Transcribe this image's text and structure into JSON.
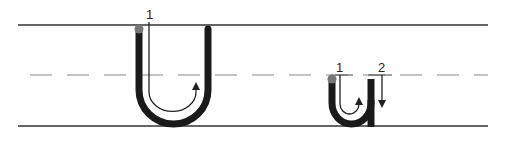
{
  "diagram": {
    "colors": {
      "background": "#ffffff",
      "guide_line": "#333333",
      "dashed_line": "#888888",
      "stroke": "#1a1a1a",
      "start_dot": "#777777",
      "arrow": "#222222"
    },
    "guide_lines": {
      "top_y": 25,
      "mid_y": 75,
      "base_y": 126,
      "x_start": 18,
      "x_end": 488
    },
    "letters": [
      {
        "id": "uppercase-U",
        "glyph": "U",
        "stroke_labels": [
          {
            "label": "1",
            "x": 150,
            "y": 18
          }
        ]
      },
      {
        "id": "lowercase-u",
        "glyph": "u",
        "stroke_labels": [
          {
            "label": "1",
            "x": 340,
            "y": 71
          },
          {
            "label": "2",
            "x": 382,
            "y": 71
          }
        ]
      }
    ]
  }
}
